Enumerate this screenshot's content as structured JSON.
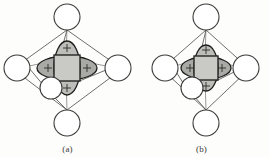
{
  "figure": {
    "type": "chemistry-diagram",
    "background_color": "#fdfdfc",
    "panels": [
      {
        "id": "a",
        "caption": "(a)",
        "metal": {
          "label": "",
          "shape": "square",
          "fill": "#c9c9c6",
          "stroke": "#262624",
          "center": [
            67,
            68
          ],
          "half_size": 13
        },
        "orbital": {
          "name": "d-orbital",
          "lobe_count": 4,
          "sign_label": "+",
          "signs": [
            "+",
            "+",
            "+",
            "+"
          ],
          "fill": "#bdbdba",
          "stroke": "#1d1d1b",
          "horizontal_radius": 30,
          "vertical_radius": 27,
          "size_note": "large"
        },
        "ligands": [
          {
            "name": "ligand-top",
            "center": [
              67,
              17
            ],
            "r": 13
          },
          {
            "name": "ligand-left",
            "center": [
              17,
              68
            ],
            "r": 13
          },
          {
            "name": "ligand-right",
            "center": [
              118,
              68
            ],
            "r": 13
          },
          {
            "name": "ligand-bottom",
            "center": [
              67,
              123
            ],
            "r": 13
          },
          {
            "name": "ligand-front",
            "center": [
              51,
              88
            ],
            "r": 11
          },
          {
            "name": "ligand-back",
            "center": [
              67,
              60
            ],
            "r": 9
          }
        ],
        "bond_count": 12
      },
      {
        "id": "b",
        "caption": "(b)",
        "metal": {
          "label": "",
          "shape": "square",
          "fill": "#c9c9c6",
          "stroke": "#262624",
          "center": [
            72,
            68
          ],
          "half_size": 12
        },
        "orbital": {
          "name": "d-orbital",
          "lobe_count": 4,
          "sign_label": "+",
          "signs": [
            "+",
            "+",
            "+",
            "+"
          ],
          "fill": "#bdbdba",
          "stroke": "#1d1d1b",
          "horizontal_radius": 25,
          "vertical_radius": 23,
          "size_note": "small"
        },
        "ligands": [
          {
            "name": "ligand-top",
            "center": [
              72,
              17
            ],
            "r": 13
          },
          {
            "name": "ligand-left",
            "center": [
              31,
              68
            ],
            "r": 13
          },
          {
            "name": "ligand-right",
            "center": [
              112,
              68
            ],
            "r": 13
          },
          {
            "name": "ligand-bottom",
            "center": [
              72,
              123
            ],
            "r": 13
          },
          {
            "name": "ligand-front",
            "center": [
              58,
              88
            ],
            "r": 11
          },
          {
            "name": "ligand-back",
            "center": [
              72,
              60
            ],
            "r": 9
          }
        ],
        "bond_count": 12
      }
    ]
  }
}
